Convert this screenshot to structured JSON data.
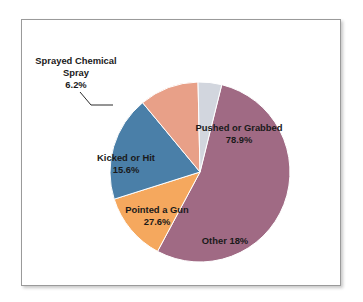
{
  "figure": {
    "background_color": "#ffffff",
    "frame_color": "#9a9a9a"
  },
  "chart_data": {
    "type": "pie",
    "title": "",
    "subtitle": "",
    "xlabel": "",
    "ylabel": "",
    "legend_position": "none",
    "grid": false,
    "note": "Percentages are of respondents and sum to more than 100% because multiple responses were allowed; wedge angles are proportional to each category's share of total responses.",
    "total_percent": 146.3,
    "categories": [
      "Pushed or Grabbed",
      "Other",
      "Pointed a Gun",
      "Kicked or Hit",
      "Sprayed Chemical Spray"
    ],
    "values": [
      78.9,
      18.0,
      27.6,
      15.6,
      6.2
    ],
    "value_labels": [
      "78.9%",
      "18%",
      "27.6%",
      "15.6%",
      "6.2%"
    ],
    "colors": [
      "#A06A84",
      "#F5A85E",
      "#4A7FA8",
      "#E8A088",
      "#D2D6DE"
    ],
    "slices": [
      {
        "name": "Pushed or Grabbed",
        "value": 78.9,
        "value_label": "78.9%",
        "color": "#A06A84",
        "label_placement": "inside",
        "label_x": 239,
        "label_y": 131
      },
      {
        "name": "Other",
        "value": 18.0,
        "value_label": "18%",
        "color": "#F5A85E",
        "label_placement": "inside-single-line",
        "label_x": 225,
        "label_y": 244
      },
      {
        "name": "Pointed a Gun",
        "value": 27.6,
        "value_label": "27.6%",
        "color": "#4A7FA8",
        "label_placement": "inside",
        "label_x": 157,
        "label_y": 213
      },
      {
        "name": "Kicked or Hit",
        "value": 15.6,
        "value_label": "15.6%",
        "color": "#E8A088",
        "label_placement": "inside",
        "label_x": 126,
        "label_y": 161
      },
      {
        "name": "Sprayed Chemical Spray",
        "value": 6.2,
        "value_label": "6.2%",
        "color": "#D2D6DE",
        "label_placement": "callout",
        "label_line1": "Sprayed Chemical",
        "label_line2": "Spray",
        "label_x": 76,
        "label_y": 64
      }
    ],
    "geometry": {
      "center_x": 200,
      "center_y": 172,
      "radius": 90,
      "start_angle_deg": -76
    }
  },
  "callout": {
    "sprayed_line1": "Sprayed Chemical",
    "sprayed_line2": "Spray",
    "sprayed_value": "6.2%"
  }
}
